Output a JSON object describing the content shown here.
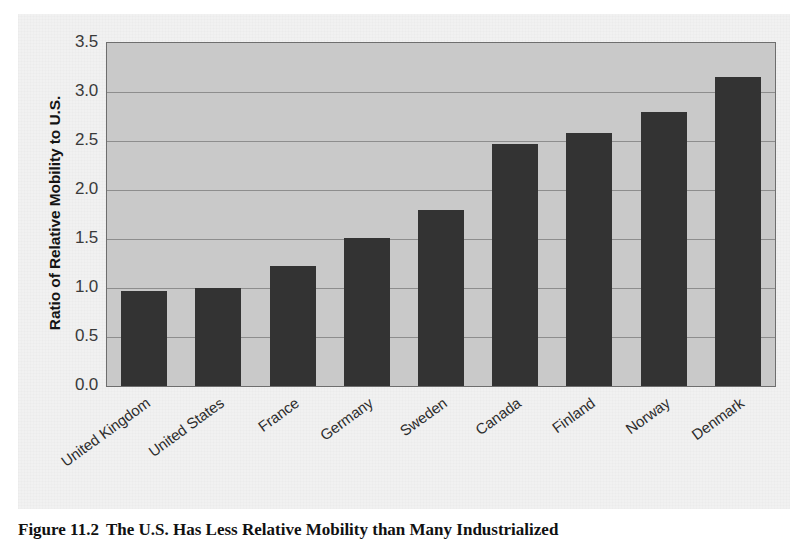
{
  "figure": {
    "caption_number": "Figure 11.2",
    "caption_text": "The U.S. Has Less Relative Mobility than Many Industrialized"
  },
  "chart_data": {
    "type": "bar",
    "title": "",
    "xlabel": "",
    "ylabel": "Ratio of Relative Mobility to U.S.",
    "ylim": [
      0.0,
      3.5
    ],
    "ytick_labels": [
      "3.5",
      "3.0",
      "2.5",
      "2.0",
      "1.5",
      "1.0",
      "0.5",
      "0.0"
    ],
    "ytick_values": [
      3.5,
      3.0,
      2.5,
      2.0,
      1.5,
      1.0,
      0.5,
      0.0
    ],
    "grid": true,
    "legend": "none",
    "categories": [
      "United Kingdom",
      "United States",
      "France",
      "Germany",
      "Sweden",
      "Canada",
      "Finland",
      "Norway",
      "Denmark"
    ],
    "values": [
      0.97,
      1.0,
      1.22,
      1.51,
      1.8,
      2.47,
      2.58,
      2.8,
      3.15
    ],
    "bar_color": "#333333",
    "plot_background": "#c9c9c9",
    "gridline_color": "#8d8d8d"
  }
}
